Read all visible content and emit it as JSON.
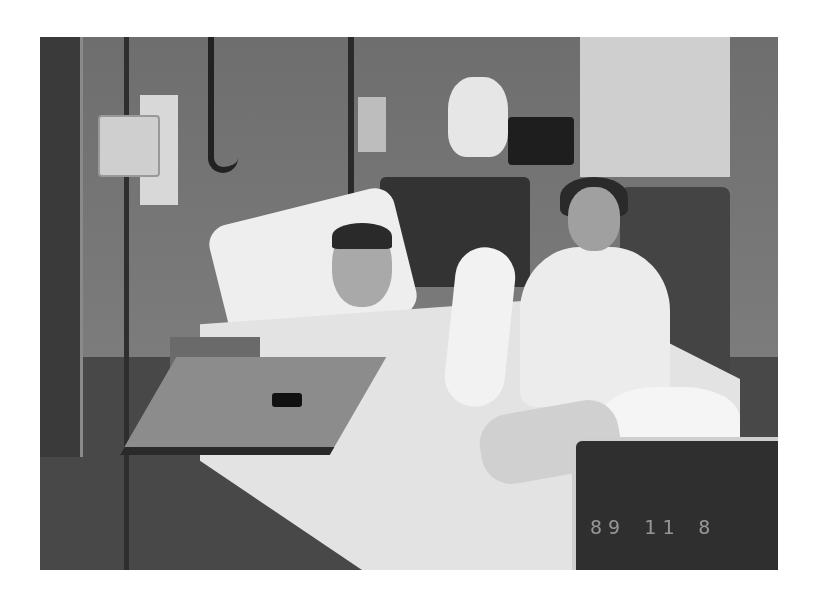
{
  "photo": {
    "description": "Black-and-white snapshot of a hospital room: a patient in bed with a raised arm cast and leg cast, a smiling woman seated beside the bed, IV pole and pump at left, overbed tray table in front, medical equipment and a teddy bear in the background.",
    "datestamp": "89 11  8"
  }
}
